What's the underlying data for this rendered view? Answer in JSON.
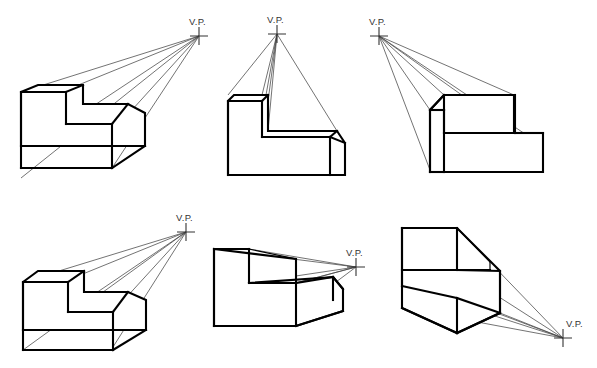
{
  "document": {
    "title": "One-Point Perspective: Vanishing Point Placement Study",
    "background_color": "#ffffff",
    "line_color": "#000000",
    "ray_color": "#444444",
    "width": 597,
    "height": 368
  },
  "labels": {
    "vanishing_point": "V.P."
  },
  "figures": [
    {
      "id": "figure-1",
      "name": "vp-upper-right-far",
      "vp_label": "V.P.",
      "vp": {
        "x": 199,
        "y": 36
      },
      "label_pos": {
        "x": 189,
        "y": 25
      },
      "description": "L-shaped block with vanishing point high and far to the right; top and right faces visible"
    },
    {
      "id": "figure-2",
      "name": "vp-directly-above",
      "vp_label": "V.P.",
      "vp": {
        "x": 277,
        "y": 34
      },
      "label_pos": {
        "x": 267,
        "y": 23
      },
      "description": "L-shaped block with vanishing point directly above the object; top faces visible, no side recession"
    },
    {
      "id": "figure-3",
      "name": "vp-upper-left",
      "vp_label": "V.P.",
      "vp": {
        "x": 379,
        "y": 36
      },
      "label_pos": {
        "x": 369,
        "y": 25
      },
      "description": "L-shaped block with vanishing point above and to the left; left and top faces visible"
    },
    {
      "id": "figure-4",
      "name": "vp-upper-right-near",
      "vp_label": "V.P.",
      "vp": {
        "x": 186,
        "y": 232
      },
      "label_pos": {
        "x": 176,
        "y": 221
      },
      "description": "L-shaped block with vanishing point up and to the right, closer to object"
    },
    {
      "id": "figure-5",
      "name": "vp-right-horizon",
      "vp_label": "V.P.",
      "vp": {
        "x": 356,
        "y": 267
      },
      "label_pos": {
        "x": 346,
        "y": 256
      },
      "description": "L-shaped block with vanishing point at mid-height right; top of step visible"
    },
    {
      "id": "figure-6",
      "name": "vp-lower-right",
      "vp_label": "V.P.",
      "vp": {
        "x": 563,
        "y": 338
      },
      "label_pos": {
        "x": 566,
        "y": 327
      },
      "description": "L-shaped block with vanishing point low and to the right; bottom and right faces visible"
    }
  ]
}
